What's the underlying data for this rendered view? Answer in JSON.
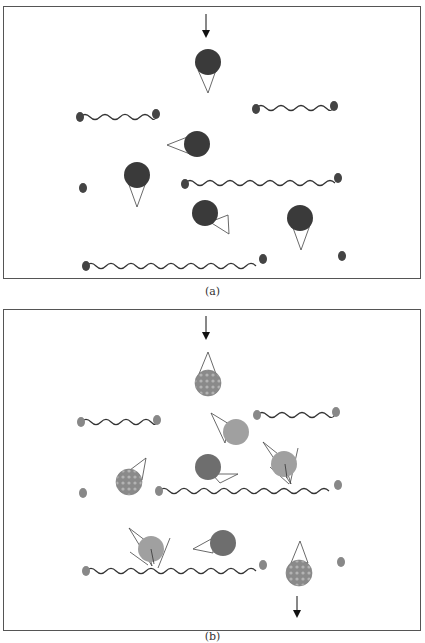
{
  "figure": {
    "panels": [
      {
        "id": "a",
        "caption": "(a)",
        "description": "Dark spheres with cone-shaped tails moving among wavy chain molecules and small dots; downward arrow at top"
      },
      {
        "id": "b",
        "caption": "(b)",
        "description": "Grey/patterned spheres with cone-shaped tails interacting with wavy chain molecules; arrows at top (incoming) and bottom right (outgoing)"
      }
    ],
    "colors": {
      "sphere_dark": "#3a3a3a",
      "sphere_grey": "#8c8c8c",
      "sphere_light": "#a8a8a8",
      "sphere_pattern": "#8a8a8a",
      "chain": "#333333",
      "border": "#555555"
    }
  }
}
